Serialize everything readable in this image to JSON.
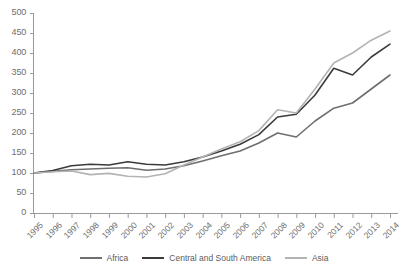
{
  "chart_data": {
    "type": "line",
    "title": "",
    "subtitle": "",
    "xlabel": "",
    "ylabel": "",
    "grid": false,
    "legend_position": "bottom",
    "xlim": [
      1995,
      2014
    ],
    "ylim": [
      0,
      500
    ],
    "ytick_step": 50,
    "x": [
      1995,
      1996,
      1997,
      1998,
      1999,
      2000,
      2001,
      2002,
      2003,
      2004,
      2005,
      2006,
      2007,
      2008,
      2009,
      2010,
      2011,
      2012,
      2013,
      2014
    ],
    "xticklabels": [
      "1995",
      "1996",
      "1997",
      "1998",
      "1999",
      "2000",
      "2001",
      "2002",
      "2003",
      "2004",
      "2005",
      "2006",
      "2007",
      "2008",
      "2009",
      "2010",
      "2011",
      "2012",
      "2013",
      "2014"
    ],
    "yticklabels": [
      "0",
      "50",
      "100",
      "150",
      "200",
      "250",
      "300",
      "350",
      "400",
      "450",
      "500"
    ],
    "series": [
      {
        "name": "Africa",
        "color": "#6f6f6f",
        "values": [
          100,
          104,
          108,
          110,
          112,
          113,
          107,
          110,
          118,
          130,
          143,
          155,
          175,
          200,
          190,
          230,
          262,
          275,
          310,
          345
        ]
      },
      {
        "name": "Central and South America",
        "color": "#3b3b3b",
        "values": [
          100,
          106,
          118,
          122,
          120,
          128,
          122,
          120,
          128,
          140,
          155,
          172,
          196,
          240,
          247,
          295,
          362,
          345,
          390,
          422
        ]
      },
      {
        "name": "Asia",
        "color": "#b3b3b3",
        "values": [
          100,
          103,
          105,
          96,
          99,
          92,
          90,
          98,
          120,
          140,
          160,
          178,
          206,
          258,
          250,
          310,
          375,
          400,
          432,
          455
        ]
      }
    ]
  },
  "legend": {
    "items": [
      {
        "label": "Africa",
        "color": "#6f6f6f"
      },
      {
        "label": "Central and South America",
        "color": "#3b3b3b"
      },
      {
        "label": "Asia",
        "color": "#b3b3b3"
      }
    ]
  },
  "axes": {
    "axis_color": "#9a9a9a",
    "tick_color": "#9a9a9a",
    "label_color": "#6e6e6e"
  }
}
